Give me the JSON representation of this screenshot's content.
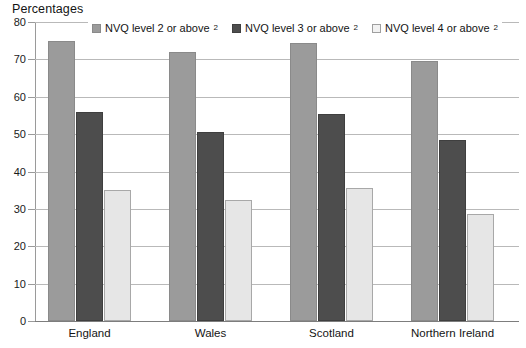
{
  "chart_data": {
    "type": "bar",
    "title": "Percentages",
    "xlabel": "",
    "ylabel": "Percentages",
    "ylim": [
      0,
      80
    ],
    "yticks": [
      0,
      10,
      20,
      30,
      40,
      50,
      60,
      70,
      80
    ],
    "grid": true,
    "legend_position": "top",
    "categories": [
      "England",
      "Wales",
      "Scotland",
      "Northern Ireland"
    ],
    "series": [
      {
        "name": "NVQ level 2 or above",
        "note_marker": "2",
        "color": "#9b9b9b",
        "values": [
          75,
          72,
          74.5,
          69.5
        ]
      },
      {
        "name": "NVQ level 3 or above",
        "note_marker": "2",
        "color": "#4d4d4d",
        "values": [
          56,
          50.5,
          55.5,
          48.5
        ]
      },
      {
        "name": "NVQ level 4 or above",
        "note_marker": "2",
        "color": "#e6e6e6",
        "values": [
          35,
          32.5,
          35.5,
          28.5
        ]
      }
    ]
  },
  "axis": {
    "y_title": "Percentages"
  }
}
